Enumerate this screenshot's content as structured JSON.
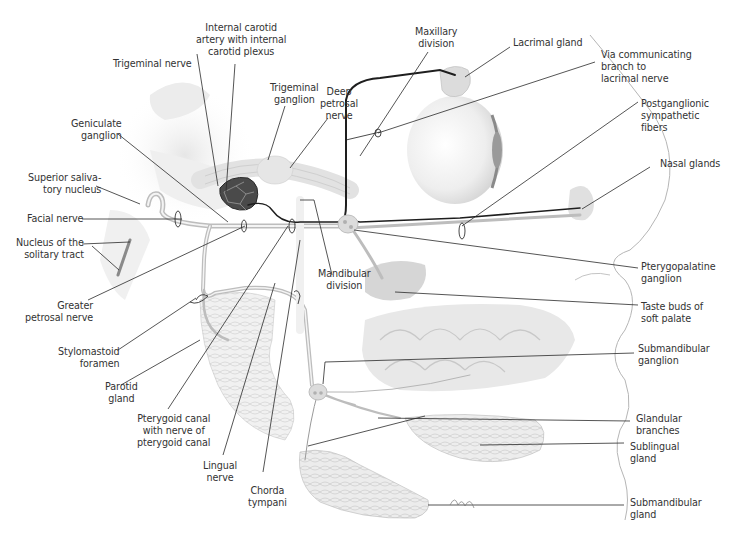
{
  "diagram": {
    "type": "anatomical-illustration",
    "colors": {
      "nerve_dark": "#1e1e1e",
      "nerve_grey": "#bdbdbd",
      "leader_line": "#2a2a2a",
      "gland_fill": "#e4e4e4",
      "tissue_shade": "#d8d8d8",
      "carotid": "#4a4a4a",
      "label_text": "#333333"
    }
  },
  "labels": {
    "internal_carotid": "Internal carotid\nartery with internal\ncarotid plexus",
    "trigeminal_nerve": "Trigeminal nerve",
    "maxillary_division": "Maxillary\ndivision",
    "lacrimal_gland": "Lacrimal gland",
    "via_communicating": "Via communicating\nbranch to\nlacrimal nerve",
    "trigeminal_ganglion": "Trigeminal\nganglion",
    "deep_petrosal": "Deep\npetrosal\nnerve",
    "geniculate_ganglion": "Geniculate\nganglion",
    "postganglionic": "Postganglionic\nsympathetic\nfibers",
    "superior_salivatory": "Superior saliva-\ntory nucleus",
    "nasal_glands": "Nasal glands",
    "facial_nerve": "Facial nerve",
    "nucleus_solitary": "Nucleus of the\nsolitary tract",
    "mandibular_division": "Mandibular\ndivision",
    "pterygopalatine_ganglion": "Pterygopalatine\nganglion",
    "greater_petrosal": "Greater\npetrosal nerve",
    "taste_buds": "Taste buds of\nsoft palate",
    "stylomastoid": "Stylomastoid\nforamen",
    "submandibular_ganglion": "Submandibular\nganglion",
    "parotid_gland": "Parotid\ngland",
    "pterygoid_canal": "Pterygoid canal\nwith nerve of\npterygoid canal",
    "glandular_branches": "Glandular\nbranches",
    "sublingual_gland": "Sublingual\ngland",
    "lingual_nerve": "Lingual\nnerve",
    "chorda_tympani": "Chorda\ntympani",
    "submandibular_gland": "Submandibular\ngland"
  }
}
